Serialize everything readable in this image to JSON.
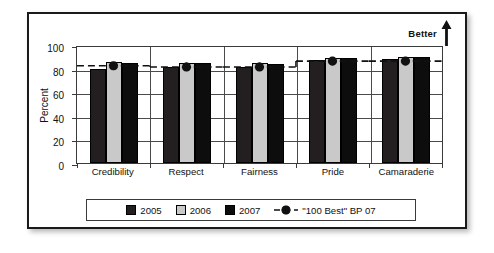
{
  "chart_data": {
    "type": "bar",
    "title": "",
    "xlabel": "",
    "ylabel": "Percent",
    "ylim": [
      0,
      100
    ],
    "yticks": [
      0,
      20,
      40,
      60,
      80,
      100
    ],
    "grid": true,
    "legend_position": "bottom",
    "categories": [
      "Credibility",
      "Respect",
      "Fairness",
      "Pride",
      "Camaraderie"
    ],
    "series": [
      {
        "name": "2005",
        "color": "#231f20",
        "values": [
          80,
          81,
          81,
          87,
          88
        ]
      },
      {
        "name": "2006",
        "color": "#c9c9c9",
        "values": [
          86,
          85,
          85,
          89,
          90
        ]
      },
      {
        "name": "2007",
        "color": "#0d0d0d",
        "values": [
          85,
          85,
          84,
          89,
          90
        ]
      },
      {
        "name": "\"100 Best\" BP 07",
        "marker": "star",
        "line": "dashed",
        "color": "#111111",
        "values": [
          84,
          83,
          83,
          88,
          88
        ]
      }
    ],
    "annotations": [
      {
        "text": "Better",
        "arrow": "up",
        "position": "top-right"
      }
    ]
  },
  "axis": {
    "ylabel": "Percent",
    "ytick_labels": [
      "100",
      "80",
      "60",
      "40",
      "20",
      "0"
    ]
  },
  "annotation": {
    "better_label": "Better"
  },
  "legend": {
    "items": [
      {
        "label": "2005"
      },
      {
        "label": "2006"
      },
      {
        "label": "2007"
      },
      {
        "label": "\"100 Best\" BP 07"
      }
    ]
  }
}
